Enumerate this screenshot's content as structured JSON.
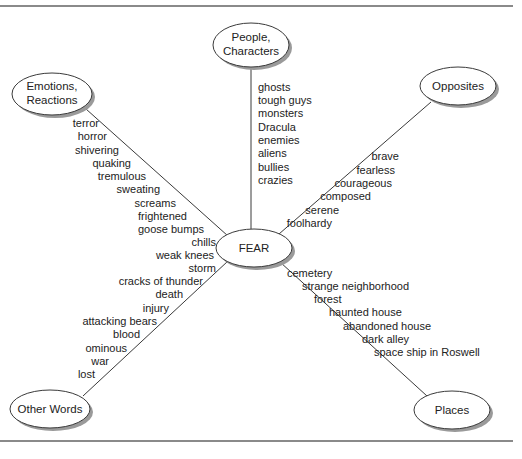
{
  "diagram": {
    "center": {
      "label": "FEAR"
    },
    "branches": [
      {
        "id": "emotions",
        "label_lines": [
          "Emotions,",
          "Reactions"
        ],
        "words": [
          "terror",
          "horror",
          "shivering",
          "quaking",
          "tremulous",
          "sweating",
          "screams",
          "frightened",
          "goose bumps",
          "chills",
          "weak knees"
        ]
      },
      {
        "id": "people",
        "label_lines": [
          "People,",
          "Characters"
        ],
        "words": [
          "ghosts",
          "tough guys",
          "monsters",
          "Dracula",
          "enemies",
          "aliens",
          "bullies",
          "crazies"
        ]
      },
      {
        "id": "opposites",
        "label_lines": [
          "Opposites"
        ],
        "words": [
          "brave",
          "fearless",
          "courageous",
          "composed",
          "serene",
          "foolhardy"
        ]
      },
      {
        "id": "other-words",
        "label_lines": [
          "Other Words"
        ],
        "words": [
          "storm",
          "cracks of thunder",
          "death",
          "injury",
          "attacking bears",
          "blood",
          "ominous",
          "war",
          "lost"
        ]
      },
      {
        "id": "places",
        "label_lines": [
          "Places"
        ],
        "words": [
          "cemetery",
          "strange neighborhood",
          "forest",
          "haunted house",
          "abandoned house",
          "dark alley",
          "space ship in Roswell"
        ]
      }
    ],
    "colors": {
      "line": "#3a3a3a",
      "node_fill": "#ffffff",
      "node_shadow": "#9a9a9a",
      "rule": "#8a8a8a"
    }
  }
}
